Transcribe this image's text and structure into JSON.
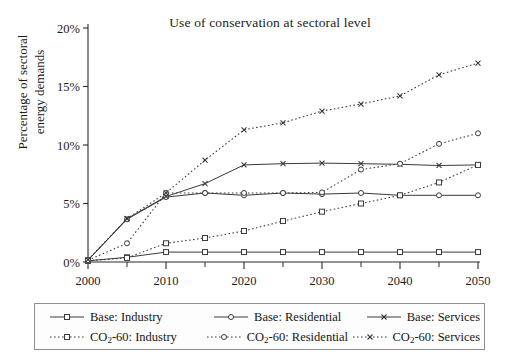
{
  "chart_data": {
    "type": "line",
    "title": "Use of conservation at sectoral level",
    "xlabel": "",
    "ylabel": "Percentage of sectoral energy demands",
    "x": [
      2000,
      2005,
      2010,
      2015,
      2020,
      2025,
      2030,
      2035,
      2040,
      2045,
      2050
    ],
    "xlim": [
      2000,
      2050
    ],
    "ylim": [
      0,
      20
    ],
    "yticks": [
      0,
      5,
      10,
      15,
      20
    ],
    "ytick_labels": [
      "0%",
      "5%",
      "10%",
      "15%",
      "20%"
    ],
    "xticks": [
      2000,
      2010,
      2020,
      2030,
      2040,
      2050
    ],
    "xtick_labels": [
      "2000",
      "2010",
      "2020",
      "2030",
      "2040",
      "2050"
    ],
    "x_minor_ticks": [
      2005,
      2015,
      2025,
      2035,
      2045
    ],
    "grid": false,
    "legend_position": "below",
    "series": [
      {
        "name": "Base: Industry",
        "style": "solid",
        "marker": "square",
        "values": [
          0.1,
          0.4,
          0.85,
          0.85,
          0.85,
          0.85,
          0.85,
          0.85,
          0.85,
          0.85,
          0.85
        ]
      },
      {
        "name": "Base: Residential",
        "style": "solid",
        "marker": "circle",
        "values": [
          0.15,
          3.65,
          5.55,
          5.9,
          5.7,
          5.9,
          5.8,
          5.9,
          5.7,
          5.7,
          5.7
        ]
      },
      {
        "name": "Base: Services",
        "style": "solid",
        "marker": "cross",
        "values": [
          0.15,
          3.7,
          5.6,
          6.7,
          8.3,
          8.4,
          8.45,
          8.4,
          8.35,
          8.25,
          8.3
        ]
      },
      {
        "name": "CO2-60: Industry",
        "style": "dotted",
        "marker": "square",
        "values": [
          0.1,
          0.35,
          1.6,
          2.05,
          2.65,
          3.5,
          4.3,
          5.0,
          5.7,
          6.8,
          8.3
        ]
      },
      {
        "name": "CO2-60: Residential",
        "style": "dotted",
        "marker": "circle",
        "values": [
          0.15,
          1.6,
          5.9,
          5.9,
          5.9,
          5.9,
          5.95,
          7.9,
          8.4,
          10.1,
          11.0
        ]
      },
      {
        "name": "CO2-60: Services",
        "style": "dotted",
        "marker": "cross",
        "values": [
          0.2,
          3.7,
          5.9,
          8.7,
          11.3,
          11.9,
          12.9,
          13.5,
          14.2,
          16.0,
          17.0
        ]
      }
    ]
  },
  "legend": {
    "rows": [
      [
        {
          "label_prefix": "Base: Industry",
          "sub": "",
          "label_suffix": "",
          "style": "solid",
          "marker": "square"
        },
        {
          "label_prefix": "Base: Residential",
          "sub": "",
          "label_suffix": "",
          "style": "solid",
          "marker": "circle"
        },
        {
          "label_prefix": "Base: Services",
          "sub": "",
          "label_suffix": "",
          "style": "solid",
          "marker": "cross"
        }
      ],
      [
        {
          "label_prefix": "CO",
          "sub": "2",
          "label_suffix": "-60: Industry",
          "style": "dotted",
          "marker": "square"
        },
        {
          "label_prefix": "CO",
          "sub": "2",
          "label_suffix": "-60: Residential",
          "style": "dotted",
          "marker": "circle"
        },
        {
          "label_prefix": "CO",
          "sub": "2",
          "label_suffix": "-60: Services",
          "style": "dotted",
          "marker": "cross"
        }
      ]
    ]
  },
  "colors": {
    "axis": "#2a2a2a",
    "series": "#3a3a3a",
    "background": "#ffffff",
    "legend_border": "#8f8f8f",
    "text": "#1b1b1b"
  }
}
